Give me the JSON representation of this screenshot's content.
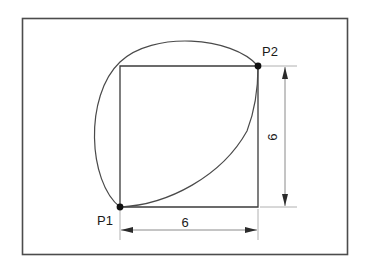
{
  "diagram": {
    "background_color": "#ffffff",
    "frame": {
      "name": "outer-border",
      "stroke_color": "#4c4c4c"
    },
    "points": [
      {
        "id": "P1",
        "label": "P1",
        "x": 120,
        "y": 207,
        "corner": "bottom-left"
      },
      {
        "id": "P2",
        "label": "P2",
        "x": 258,
        "y": 66,
        "corner": "top-right"
      }
    ],
    "square": {
      "name": "square-outline",
      "stroke_color": "#3b3b3b",
      "side_length": 6
    },
    "arcs": [
      {
        "id": "outer-arc",
        "description": "large arc bulging up and to the left from P1 to P2",
        "stroke_color": "#4a4a4a"
      },
      {
        "id": "inner-arc",
        "description": "arc from P1 curving right and up to P2 inside the square",
        "stroke_color": "#4a4a4a"
      }
    ],
    "dimensions": [
      {
        "id": "horizontal-dimension",
        "value": "6",
        "orientation": "horizontal",
        "position": "bottom",
        "from_point": "P1",
        "to_point": "bottom-right-corner"
      },
      {
        "id": "vertical-dimension",
        "value": "6",
        "orientation": "vertical",
        "position": "right",
        "from_point": "P2",
        "to_point": "bottom-right-corner"
      }
    ]
  }
}
